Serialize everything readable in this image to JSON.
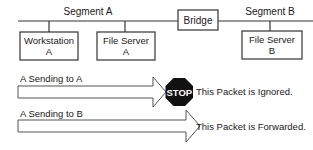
{
  "network": {
    "segment_a_label": "Segment A",
    "segment_b_label": "Segment B",
    "bridge_label": "Bridge",
    "nodes": [
      {
        "line1": "Workstation",
        "line2": "A"
      },
      {
        "line1": "File Server",
        "line2": "A"
      },
      {
        "line1": "File Server",
        "line2": "B"
      }
    ]
  },
  "scenarios": [
    {
      "label": "A Sending to A",
      "result": "This Packet is Ignored.",
      "icon": "stop-sign",
      "stop_text": "STOP"
    },
    {
      "label": "A Sending to B",
      "result": "This Packet is Forwarded.",
      "icon": "none"
    }
  ],
  "colors": {
    "line": "#333333",
    "stop_fill": "#111111",
    "stop_text": "#ffffff"
  }
}
